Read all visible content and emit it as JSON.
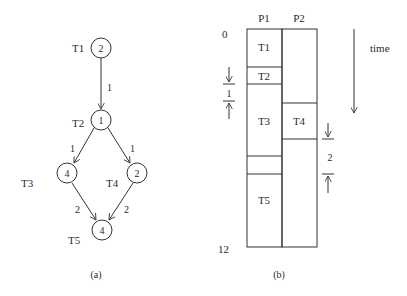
{
  "task_graph": {
    "caption": "(a)",
    "nodes": [
      {
        "id": "T1",
        "label": "T1",
        "weight": "2"
      },
      {
        "id": "T2",
        "label": "T2",
        "weight": "1"
      },
      {
        "id": "T3",
        "label": "T3",
        "weight": "4"
      },
      {
        "id": "T4",
        "label": "T4",
        "weight": "2"
      },
      {
        "id": "T5",
        "label": "T5",
        "weight": "4"
      }
    ],
    "edges": [
      {
        "from": "T1",
        "to": "T2",
        "weight": "1"
      },
      {
        "from": "T2",
        "to": "T3",
        "weight": "1"
      },
      {
        "from": "T2",
        "to": "T4",
        "weight": "1"
      },
      {
        "from": "T3",
        "to": "T5",
        "weight": "2"
      },
      {
        "from": "T4",
        "to": "T5",
        "weight": "2"
      }
    ]
  },
  "schedule": {
    "caption": "(b)",
    "processors": [
      "P1",
      "P2"
    ],
    "time_start_label": "0",
    "time_end_label": "12",
    "time_axis_label": "time",
    "comm_delay_left": "1",
    "comm_delay_right": "2",
    "p1_blocks": [
      {
        "label": "T1"
      },
      {
        "label": "T2"
      },
      {
        "label": "T3"
      },
      {
        "label": ""
      },
      {
        "label": "T5"
      }
    ],
    "p2_blocks": [
      {
        "label": ""
      },
      {
        "label": "T4"
      },
      {
        "label": ""
      }
    ]
  }
}
